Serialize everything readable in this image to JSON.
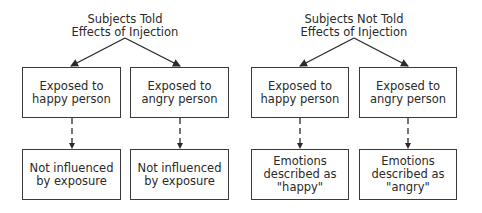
{
  "diagram": {
    "groups": [
      {
        "title_line1": "Subjects Told",
        "title_line2": "Effects of Injection",
        "conditions": [
          {
            "exposure": "Exposed to\nhappy person",
            "outcome": "Not influenced\nby exposure"
          },
          {
            "exposure": "Exposed to\nangry person",
            "outcome": "Not influenced\nby exposure"
          }
        ]
      },
      {
        "title_line1": "Subjects Not Told",
        "title_line2": "Effects of Injection",
        "conditions": [
          {
            "exposure": "Exposed to\nhappy person",
            "outcome": "Emotions\ndescribed as\n\"happy\""
          },
          {
            "exposure": "Exposed to\nangry person",
            "outcome": "Emotions\ndescribed as\n\"angry\""
          }
        ]
      }
    ],
    "colors": {
      "line": "#2a2a2a",
      "background": "#ffffff"
    }
  }
}
